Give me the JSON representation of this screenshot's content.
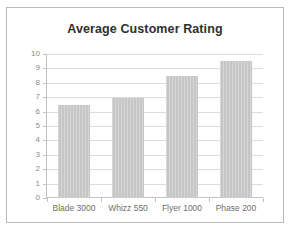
{
  "chart_data": {
    "type": "bar",
    "title": "Average Customer Rating",
    "xlabel": "",
    "ylabel": "",
    "categories": [
      "Blade 3000",
      "Whizz 550",
      "Flyer 1000",
      "Phase 200"
    ],
    "values": [
      6.45,
      6.95,
      8.45,
      9.5
    ],
    "ylim": [
      0,
      10
    ],
    "ytick_step": 1,
    "yticks": [
      "10",
      "9",
      "8",
      "7",
      "6",
      "5",
      "4",
      "3",
      "2",
      "1",
      "0"
    ],
    "grid": true,
    "legend": false,
    "legend_position": "none",
    "series": [
      {
        "name": "Average Customer Rating",
        "values": [
          6.45,
          6.95,
          8.45,
          9.5
        ]
      }
    ],
    "colors": {
      "bar_fill": "#c6c6c6",
      "gridline": "#dcdcdc",
      "axis_line": "#c3c3c3",
      "title_text": "#2f2f2f",
      "tick_text": "#8a8a8a",
      "category_text": "#6e6e6e",
      "frame_border": "#b9b9b9",
      "background": "#ffffff"
    }
  }
}
